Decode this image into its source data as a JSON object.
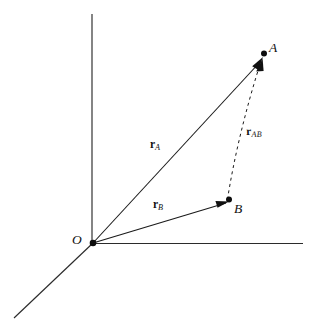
{
  "figure": {
    "type": "vector-diagram",
    "background_color": "#ffffff",
    "line_color": "#1a1a1a",
    "axis_color": "#2b2b2b",
    "width": 317,
    "height": 333
  },
  "points": {
    "origin": {
      "label": "O",
      "x": 93,
      "y": 243
    },
    "a": {
      "label": "A",
      "x": 263,
      "y": 57
    },
    "b": {
      "label": "B",
      "x": 228,
      "y": 201
    }
  },
  "axes": [
    {
      "name": "vertical-axis",
      "x1": 92,
      "y1": 14,
      "x2": 92,
      "y2": 243
    },
    {
      "name": "horizontal-axis",
      "x1": 93,
      "y1": 243,
      "x2": 303,
      "y2": 243
    },
    {
      "name": "depth-axis",
      "x1": 93,
      "y1": 243,
      "x2": 14,
      "y2": 318
    }
  ],
  "vectors": [
    {
      "name": "r-a",
      "symbol": "r",
      "subscript": "A",
      "style": "solid",
      "from": "O",
      "to": "A",
      "x1": 93,
      "y1": 243,
      "x2": 262,
      "y2": 60
    },
    {
      "name": "r-b",
      "symbol": "r",
      "subscript": "B",
      "style": "solid",
      "from": "O",
      "to": "B",
      "x1": 93,
      "y1": 243,
      "x2": 226,
      "y2": 203
    },
    {
      "name": "r-ab",
      "symbol": "r",
      "subscript": "AB",
      "style": "dashed",
      "from": "B",
      "to": "A",
      "x1": 228,
      "y1": 200,
      "x2": 263,
      "y2": 62
    }
  ]
}
